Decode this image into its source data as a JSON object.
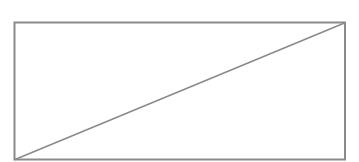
{
  "placeholder": {
    "kind": "image-placeholder",
    "stroke_color": "#8a8a8a",
    "background_color": "#ffffff",
    "stroke_width": 2,
    "frame": {
      "x": 14.5,
      "y": 22.5,
      "width": 330.5,
      "height": 137
    },
    "diagonal": {
      "x1": 15,
      "y1": 159.5,
      "x2": 344.5,
      "y2": 23
    }
  }
}
